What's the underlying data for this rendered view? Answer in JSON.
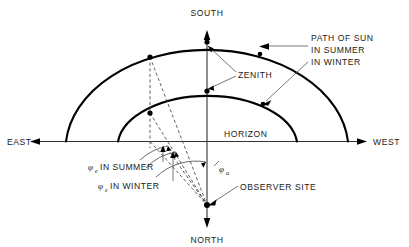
{
  "diagram": {
    "compass": {
      "south": "SOUTH",
      "north": "NORTH",
      "east": "EAST",
      "west": "WEST"
    },
    "labels": {
      "zenith": "ZENITH",
      "horizon": "HORIZON",
      "observer_site": "OBSERVER SITE",
      "path_of_sun": "PATH OF SUN",
      "in_summer": "IN SUMMER",
      "in_winter": "IN WINTER",
      "phi_e_summer_symbol": "φ",
      "phi_e_summer_sub": "e",
      "phi_e_summer_text": "IN SUMMER",
      "phi_e_winter_symbol": "φ",
      "phi_e_winter_sub": "e",
      "phi_e_winter_text": "IN WINTER",
      "phi_a_symbol": "φ",
      "phi_a_sub": "a"
    },
    "colors": {
      "line": "#000000",
      "axis": "#333333",
      "leader": "#555555",
      "dashed": "#444444",
      "background": "#ffffff"
    }
  }
}
